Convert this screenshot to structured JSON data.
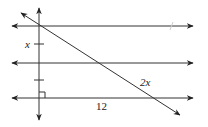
{
  "diagram": {
    "type": "geometry",
    "labels": {
      "segment_upper": "x",
      "segment_lower_diagonal": "2x",
      "bottom_length": "12"
    },
    "colors": {
      "line": "#333333",
      "text": "#222222",
      "faint_mark": "#cccccc"
    }
  }
}
